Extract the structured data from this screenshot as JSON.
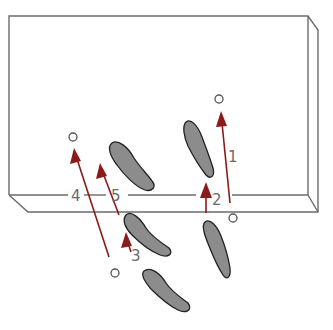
{
  "diagram": {
    "colors": {
      "outline": "#6b6b6b",
      "arrow": "#8b1a1a",
      "footprint_fill": "#8c8c8c",
      "footprint_stroke": "#222222",
      "marker": "#555555",
      "label": "#6a6a6a"
    },
    "arrows": [
      {
        "label": "1",
        "from": [
          230,
          203
        ],
        "to": [
          221,
          111
        ]
      },
      {
        "label": "2",
        "from": [
          206,
          213
        ],
        "to": [
          206,
          182
        ]
      },
      {
        "label": "3",
        "from": [
          131,
          252
        ],
        "to": [
          126,
          232
        ]
      },
      {
        "label": "4",
        "from": [
          109,
          257
        ],
        "to": [
          74,
          148
        ]
      },
      {
        "label": "5",
        "from": [
          119,
          215
        ],
        "to": [
          100,
          163
        ]
      }
    ],
    "markers": [
      {
        "name": "marker-top-right",
        "x": 219,
        "y": 99
      },
      {
        "name": "marker-left",
        "x": 73,
        "y": 137
      },
      {
        "name": "marker-front-right",
        "x": 233,
        "y": 218
      },
      {
        "name": "marker-bottom",
        "x": 115,
        "y": 273
      }
    ],
    "labels": [
      "1",
      "2",
      "3",
      "4",
      "5"
    ]
  }
}
